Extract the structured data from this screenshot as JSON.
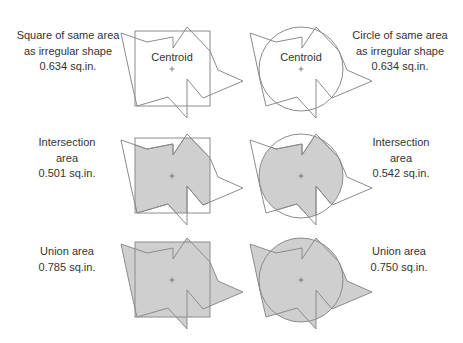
{
  "colors": {
    "stroke": "#8c8c8c",
    "fill": "#cfcfcf",
    "text": "#333333",
    "background": "#ffffff"
  },
  "shape": {
    "polygon_relative_to_centroid": [
      [
        -51,
        -36
      ],
      [
        -25,
        -27
      ],
      [
        1,
        -32
      ],
      [
        1,
        -21
      ],
      [
        15,
        -42
      ],
      [
        38,
        -18
      ],
      [
        46,
        1
      ],
      [
        71,
        12
      ],
      [
        31,
        29
      ],
      [
        15,
        10
      ],
      [
        15,
        49
      ],
      [
        -4,
        28
      ],
      [
        -35,
        37
      ],
      [
        -41,
        11
      ]
    ],
    "square_half_size": 37.5,
    "circle_radius": 42
  },
  "rows": [
    {
      "id": "equal-area",
      "left": {
        "lines": [
          "Square of same area",
          "as irregular shape",
          "0.634 sq.in."
        ],
        "centroid_label": "Centroid"
      },
      "right": {
        "lines": [
          "Circle of same area",
          "as irregular shape",
          "0.634 sq.in."
        ],
        "centroid_label": "Centroid"
      }
    },
    {
      "id": "intersection",
      "left": {
        "lines": [
          "Intersection",
          "area",
          "0.501 sq.in."
        ]
      },
      "right": {
        "lines": [
          "Intersection",
          "area",
          "0.542 sq.in."
        ]
      }
    },
    {
      "id": "union",
      "left": {
        "lines": [
          "Union area",
          "0.785 sq.in."
        ]
      },
      "right": {
        "lines": [
          "Union area",
          "0.750 sq.in."
        ]
      }
    }
  ]
}
